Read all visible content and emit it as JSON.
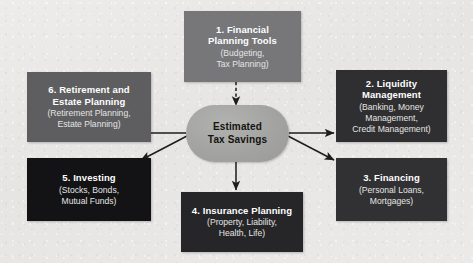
{
  "diagram": {
    "background_color": "#e8e8e6",
    "hub": {
      "label_line1": "Estimated",
      "label_line2": "Tax Savings",
      "fill": "#a3a3a1",
      "text_color": "#14140f"
    },
    "nodes": [
      {
        "id": "financial-planning-tools",
        "title_line1": "1. Financial",
        "title_line2": "Planning Tools",
        "sub_line1": "(Budgeting,",
        "sub_line2": "Tax Planning)",
        "fill": "#77777a"
      },
      {
        "id": "liquidity-management",
        "title_line1": "2. Liquidity",
        "title_line2": "Management",
        "sub_line1": "(Banking, Money",
        "sub_line2": "Management,",
        "sub_line3": "Credit Management)",
        "fill": "#2f2f31"
      },
      {
        "id": "financing",
        "title_line1": "3. Financing",
        "sub_line1": "(Personal Loans,",
        "sub_line2": "Mortgages)",
        "fill": "#313133"
      },
      {
        "id": "insurance-planning",
        "title_line1": "4. Insurance Planning",
        "sub_line1": "(Property, Liability,",
        "sub_line2": "Health, Life)",
        "fill": "#262628"
      },
      {
        "id": "investing",
        "title_line1": "5. Investing",
        "sub_line1": "(Stocks, Bonds,",
        "sub_line2": "Mutual Funds)",
        "fill": "#131315"
      },
      {
        "id": "retirement-and-estate-planning",
        "title_line1": "6. Retirement and",
        "title_line2": "Estate Planning",
        "sub_line1": "(Retirement Planning,",
        "sub_line2": "Estate Planning)",
        "fill": "#5e5e60"
      }
    ],
    "connectors": [
      {
        "id": "tools-to-hub",
        "style": "dashed",
        "direction": "down"
      },
      {
        "id": "hub-to-liquidity",
        "style": "solid",
        "direction": "right"
      },
      {
        "id": "hub-to-financing",
        "style": "solid",
        "direction": "down-right"
      },
      {
        "id": "hub-to-insurance",
        "style": "solid",
        "direction": "down"
      },
      {
        "id": "hub-to-investing",
        "style": "solid",
        "direction": "down-left"
      },
      {
        "id": "hub-to-retirement",
        "style": "solid",
        "direction": "left"
      }
    ]
  }
}
